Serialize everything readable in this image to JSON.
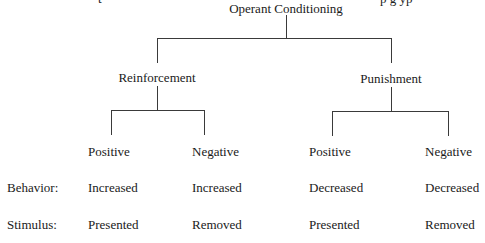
{
  "clipped_top_text": {
    "left": "t",
    "right": "p               g          yp"
  },
  "root": {
    "label": "Operant Conditioning"
  },
  "branches": [
    {
      "label": "Reinforcement",
      "children": [
        {
          "label": "Positive",
          "behavior": "Increased",
          "stimulus": "Presented"
        },
        {
          "label": "Negative",
          "behavior": "Increased",
          "stimulus": "Removed"
        }
      ]
    },
    {
      "label": "Punishment",
      "children": [
        {
          "label": "Positive",
          "behavior": "Decreased",
          "stimulus": "Presented"
        },
        {
          "label": "Negative",
          "behavior": "Decreased",
          "stimulus": "Removed"
        }
      ]
    }
  ],
  "row_labels": {
    "behavior": "Behavior:",
    "stimulus": "Stimulus:"
  }
}
